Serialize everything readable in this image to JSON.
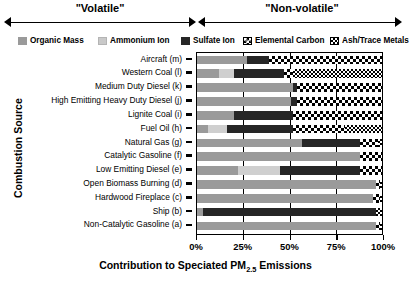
{
  "brackets": [
    {
      "label": "\"Volatile\"",
      "start_pct": 0,
      "end_pct": 50
    },
    {
      "label": "\"Non-volatile\"",
      "start_pct": 50,
      "end_pct": 100
    }
  ],
  "legend": [
    {
      "key": "om",
      "label": "Organic Mass",
      "color": "#9a9a9a"
    },
    {
      "key": "am",
      "label": "Ammonium Ion",
      "color": "#cfcfcf"
    },
    {
      "key": "su",
      "label": "Sulfate Ion",
      "color": "#262626"
    },
    {
      "key": "ec",
      "label": "Elemental Carbon",
      "color": "#ffffff"
    },
    {
      "key": "at",
      "label": "Ash/Trace Metals",
      "color": "#ffffff"
    }
  ],
  "axes": {
    "ytitle": "Combustion Source",
    "xtitle_pre": "Contribution to Speciated PM",
    "xtitle_sub": "2.5",
    "xtitle_post": " Emissions",
    "xticks": [
      {
        "value": 0,
        "label": "0%"
      },
      {
        "value": 25,
        "label": "25%"
      },
      {
        "value": 50,
        "label": "50%"
      },
      {
        "value": 75,
        "label": "75%"
      },
      {
        "value": 100,
        "label": "100%"
      }
    ],
    "xlim": [
      0,
      100
    ],
    "grid": true
  },
  "chart_data": {
    "type": "bar",
    "orientation": "horizontal",
    "stacked": true,
    "title": "",
    "xlabel": "Contribution to Speciated PM2.5 Emissions",
    "ylabel": "Combustion Source",
    "xlim": [
      0,
      100
    ],
    "legend_position": "top",
    "series": [
      {
        "name": "Organic Mass",
        "key": "om"
      },
      {
        "name": "Ammonium Ion",
        "key": "am"
      },
      {
        "name": "Sulfate Ion",
        "key": "su"
      },
      {
        "name": "Elemental Carbon",
        "key": "ec"
      },
      {
        "name": "Ash/Trace Metals",
        "key": "at"
      }
    ],
    "categories": [
      "Aircraft (m)",
      "Western Coal (l)",
      "Medium Duty Diesel (k)",
      "High Emitting Heavy Duty Diesel (j)",
      "Lignite Coal (i)",
      "Fuel Oil (h)",
      "Natural Gas (g)",
      "Catalytic Gasoline (f)",
      "Low Emitting Diesel (e)",
      "Open Biomass Burning (d)",
      "Hardwood Fireplace (c)",
      "Ship (b)",
      "Non-Catalytic Gasoline (a)"
    ],
    "rows": [
      {
        "category": "Aircraft (m)",
        "om": 27,
        "am": 0,
        "su": 12,
        "ec": 61,
        "at": 0
      },
      {
        "category": "Western Coal (l)",
        "om": 12,
        "am": 8,
        "su": 27,
        "ec": 5,
        "at": 48
      },
      {
        "category": "Medium Duty Diesel (k)",
        "om": 52,
        "am": 0,
        "su": 2,
        "ec": 46,
        "at": 0
      },
      {
        "category": "High Emitting Heavy Duty Diesel (j)",
        "om": 51,
        "am": 0,
        "su": 3,
        "ec": 46,
        "at": 0
      },
      {
        "category": "Lignite Coal (i)",
        "om": 20,
        "am": 0,
        "su": 32,
        "ec": 48,
        "at": 0
      },
      {
        "category": "Fuel Oil (h)",
        "om": 6,
        "am": 10,
        "su": 36,
        "ec": 28,
        "at": 20
      },
      {
        "category": "Natural Gas (g)",
        "om": 57,
        "am": 0,
        "su": 31,
        "ec": 10,
        "at": 2
      },
      {
        "category": "Catalytic Gasoline (f)",
        "om": 88,
        "am": 0,
        "su": 0,
        "ec": 12,
        "at": 0
      },
      {
        "category": "Low Emitting Diesel (e)",
        "om": 22,
        "am": 23,
        "su": 43,
        "ec": 12,
        "at": 0
      },
      {
        "category": "Open Biomass Burning (d)",
        "om": 97,
        "am": 0,
        "su": 0,
        "ec": 2,
        "at": 1
      },
      {
        "category": "Hardwood Fireplace (c)",
        "om": 95,
        "am": 0,
        "su": 0,
        "ec": 4,
        "at": 1
      },
      {
        "category": "Ship (b)",
        "om": 3,
        "am": 0,
        "su": 94,
        "ec": 0,
        "at": 3
      },
      {
        "category": "Non-Catalytic Gasoline (a)",
        "om": 97,
        "am": 0,
        "su": 0,
        "ec": 2,
        "at": 1
      }
    ]
  }
}
